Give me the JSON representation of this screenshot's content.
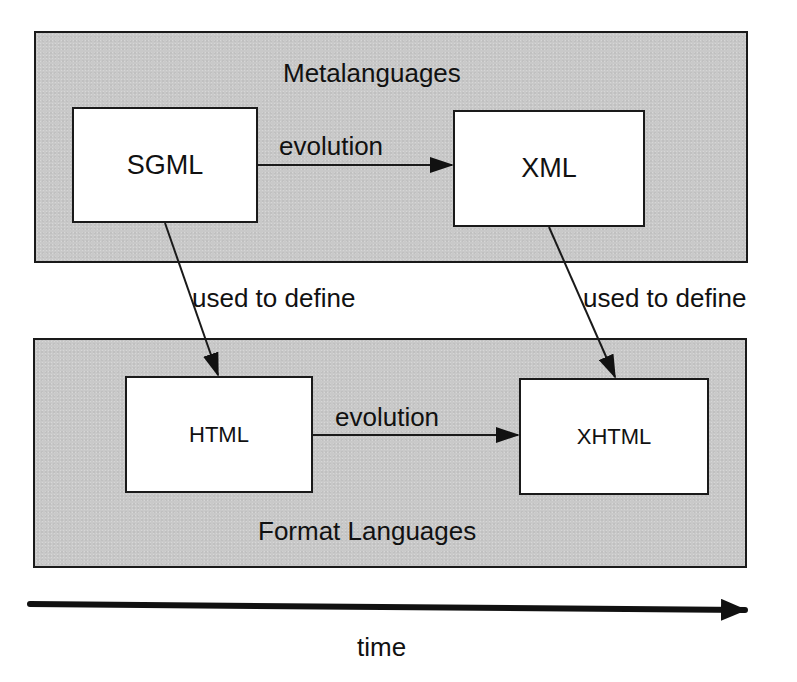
{
  "groups": {
    "meta": {
      "title": "Metalanguages"
    },
    "format": {
      "title": "Format Languages"
    }
  },
  "nodes": {
    "sgml": "SGML",
    "xml": "XML",
    "html": "HTML",
    "xhtml": "XHTML"
  },
  "edges": {
    "sgml_xml": "evolution",
    "html_xhtml": "evolution",
    "sgml_html": "used to define",
    "xml_xhtml": "used to define"
  },
  "timeline": {
    "label": "time"
  },
  "colors": {
    "panel": "#c9c9c9",
    "stroke": "#1a1a1a",
    "node_fill": "#ffffff"
  }
}
